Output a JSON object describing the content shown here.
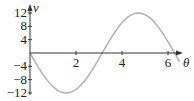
{
  "chart_data": {
    "type": "line",
    "title": "",
    "xlabel": "θ",
    "ylabel": "v",
    "xlim": [
      0,
      6.5
    ],
    "ylim": [
      -12,
      12
    ],
    "x_ticks": [
      "2",
      "4",
      "6"
    ],
    "y_ticks": [
      "12",
      "8",
      "4",
      "-4",
      "-8",
      "-12"
    ],
    "grid": false,
    "series": [
      {
        "name": "v(θ)",
        "color": "#b5b5b5",
        "formula": "v = -12 sin(θ)",
        "x": [
          0,
          0.5,
          1.0,
          1.57,
          2.0,
          2.5,
          3.14,
          3.5,
          4.0,
          4.71,
          5.0,
          5.5,
          6.28,
          6.5
        ],
        "values": [
          0,
          -5.75,
          -10.1,
          -12,
          -10.9,
          -7.2,
          0,
          4.2,
          9.1,
          12,
          11.5,
          8.5,
          0,
          -2.6
        ]
      }
    ]
  }
}
